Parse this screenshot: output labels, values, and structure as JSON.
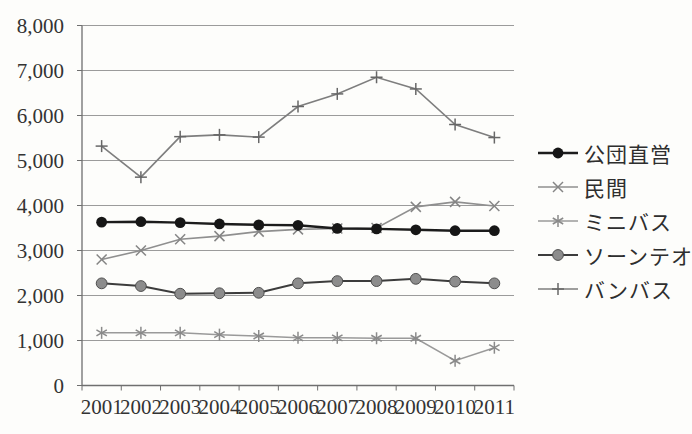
{
  "chart_data": {
    "type": "line",
    "title": "",
    "xlabel": "",
    "ylabel": "",
    "categories": [
      "2001",
      "2002",
      "2003",
      "2004",
      "2005",
      "2006",
      "2007",
      "2008",
      "2009",
      "2010",
      "2011"
    ],
    "series": [
      {
        "name": "公団直営",
        "marker": "filled-circle-black",
        "line_color": "#1c1c1c",
        "marker_color": "#161616",
        "values": [
          3630,
          3640,
          3620,
          3590,
          3570,
          3560,
          3490,
          3480,
          3460,
          3440,
          3440
        ]
      },
      {
        "name": "民間",
        "marker": "x",
        "line_color": "#8f8f8f",
        "marker_color": "#858585",
        "values": [
          2800,
          3000,
          3250,
          3320,
          3420,
          3470,
          3490,
          3500,
          3970,
          4080,
          3990
        ]
      },
      {
        "name": "ミニバス",
        "marker": "asterisk",
        "line_color": "#9a9a9a",
        "marker_color": "#8a8a8a",
        "values": [
          1170,
          1170,
          1170,
          1130,
          1100,
          1060,
          1060,
          1050,
          1050,
          550,
          840
        ]
      },
      {
        "name": "ソーンテオ",
        "marker": "filled-circle-gray",
        "line_color": "#3c3c3c",
        "marker_color": "#8c8c8c",
        "values": [
          2270,
          2210,
          2040,
          2050,
          2060,
          2270,
          2320,
          2320,
          2370,
          2310,
          2270
        ]
      },
      {
        "name": "バンバス",
        "marker": "plus",
        "line_color": "#7e7e7e",
        "marker_color": "#676767",
        "values": [
          5320,
          4630,
          5530,
          5570,
          5520,
          6200,
          6480,
          6850,
          6590,
          5800,
          5510
        ]
      }
    ],
    "ylim": [
      0,
      8000
    ],
    "ytick_interval": 1000,
    "yticklabels": [
      "0",
      "1,000",
      "2,000",
      "3,000",
      "4,000",
      "5,000",
      "6,000",
      "7,000",
      "8,000"
    ],
    "grid": true,
    "legend_position": "right",
    "axis_color": "#6f6f6f",
    "gridline_color": "#9b9b9b",
    "tick_label_color": "#333333"
  }
}
